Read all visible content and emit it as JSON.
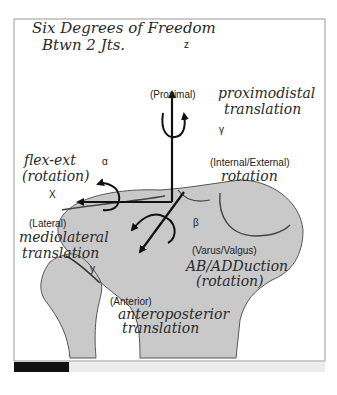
{
  "handwritten_title": {
    "line1": "Six Degrees of Freedom",
    "line2": "Btwn 2 Jts."
  },
  "axes": {
    "z": {
      "label": "z",
      "direction_label": "(Proximal)",
      "rotation_symbol": "γ"
    },
    "x": {
      "label": "X",
      "direction_label": "(Lateral)",
      "rotation_symbol": "α"
    },
    "y": {
      "label": "y",
      "direction_label": "(Anterior)",
      "rotation_symbol": "β"
    }
  },
  "printed_labels": {
    "internal_external": "(Internal/External)",
    "varus_valgus": "(Varus/Valgus)"
  },
  "handwritten_annotations": {
    "proximodistal": {
      "line1": "proximodistal",
      "line2": "translation"
    },
    "flex_ext": {
      "line1": "flex-ext",
      "line2": "(rotation)"
    },
    "int_ext_rotation": "rotation",
    "mediolateral": {
      "line1": "mediolateral",
      "line2": "translation"
    },
    "ab_adduction": {
      "line1": "AB/ADDuction",
      "line2": "(rotation)"
    },
    "anteroposterior": {
      "line1": "anteroposterior",
      "line2": "translation"
    }
  },
  "colors": {
    "bone_fill": "#c9c9c9",
    "bone_outline": "#555555",
    "arrow": "#111111",
    "bottom_bar_dark": "#111111",
    "bottom_bar_light": "#ececec"
  }
}
